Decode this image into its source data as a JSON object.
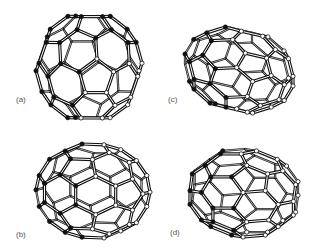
{
  "figure": {
    "background": "#ffffff",
    "ink_color": "#111111",
    "label_color": "#555555",
    "panels": [
      {
        "id": "a",
        "label": "(a)",
        "label_pos": [
          16,
          96
        ],
        "molecule": "C60",
        "view": "top-down, near-spherical cage",
        "center": [
          89,
          67
        ],
        "radius": [
          53,
          51
        ],
        "rotation": [
          0.35,
          0.15,
          0.0
        ],
        "elongation": 1.0
      },
      {
        "id": "b",
        "label": "(b)",
        "label_pos": [
          16,
          231
        ],
        "molecule": "C70-like",
        "view": "side view, mostly light atoms",
        "center": [
          93,
          191
        ],
        "radius": [
          57,
          47
        ],
        "rotation": [
          1.2,
          0.1,
          1.5708
        ],
        "elongation": 1.2
      },
      {
        "id": "c",
        "label": "(c)",
        "label_pos": [
          168,
          96
        ],
        "molecule": "C70-like",
        "view": "end-on elongated cage, dark left / light right",
        "center": [
          239,
          70
        ],
        "radius": [
          54,
          43
        ],
        "rotation": [
          0.5,
          0.9,
          1.5708
        ],
        "elongation": 1.25
      },
      {
        "id": "d",
        "label": "(d)",
        "label_pos": [
          170,
          229
        ],
        "molecule": "C70-like",
        "view": "tilted elongated cage, dark left / light right",
        "center": [
          244,
          193
        ],
        "radius": [
          54,
          44
        ],
        "rotation": [
          0.2,
          0.6,
          1.5708
        ],
        "elongation": 1.25
      }
    ]
  }
}
